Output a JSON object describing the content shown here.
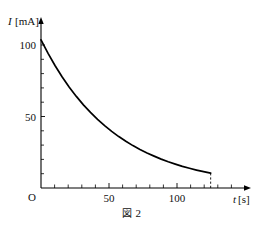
{
  "figure": {
    "caption_symbol": "図",
    "caption_number": "2",
    "caption_full": "図 2"
  },
  "axes": {
    "y_axis_title": "I[mA]",
    "y_axis_title_variable": "I",
    "y_axis_title_unit": "[mA]",
    "x_axis_title": "t[s]",
    "x_axis_title_variable": "t",
    "x_axis_title_unit": "[s]",
    "origin_label": "O",
    "y_ticks_labeled": [
      "50",
      "100"
    ],
    "x_ticks_labeled": [
      "50",
      "100"
    ]
  },
  "chart_data": {
    "type": "line",
    "title": "図 2",
    "xlabel": "t[s]",
    "ylabel": "I[mA]",
    "xlim": [
      0,
      145
    ],
    "ylim": [
      0,
      112
    ],
    "xticks": [
      0,
      10,
      20,
      30,
      40,
      50,
      60,
      70,
      80,
      90,
      100,
      110,
      120,
      130,
      140
    ],
    "xtick_labels": [
      "O",
      "",
      "",
      "",
      "",
      "50",
      "",
      "",
      "",
      "",
      "100",
      "",
      "",
      "",
      ""
    ],
    "yticks": [
      0,
      10,
      20,
      30,
      40,
      50,
      60,
      70,
      80,
      90,
      100
    ],
    "ytick_labels": [
      "",
      "",
      "",
      "",
      "",
      "50",
      "",
      "",
      "",
      "",
      "100"
    ],
    "grid": false,
    "legend": null,
    "annotations": [
      {
        "text": "dashed drop line at t = 120 s",
        "x": 120,
        "y": 10
      }
    ],
    "series": [
      {
        "name": "discharge current",
        "color": "#000000",
        "x": [
          0,
          5,
          10,
          15,
          20,
          25,
          30,
          35,
          40,
          45,
          50,
          55,
          60,
          65,
          70,
          75,
          80,
          85,
          90,
          95,
          100,
          105,
          110,
          115,
          120
        ],
        "y": [
          100,
          90.8,
          82.5,
          74.9,
          68.0,
          61.8,
          56.1,
          51.0,
          46.3,
          42.1,
          38.2,
          34.7,
          31.5,
          28.6,
          26.0,
          23.6,
          21.5,
          19.5,
          17.7,
          16.1,
          14.6,
          13.3,
          12.1,
          11.0,
          10.0
        ]
      }
    ]
  }
}
